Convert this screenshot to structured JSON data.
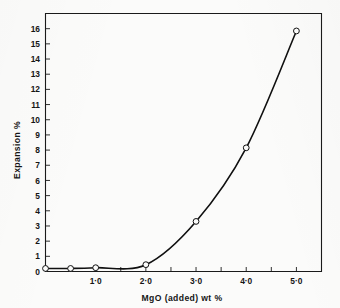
{
  "figure": {
    "background_color": "#fbfbfa",
    "ink_color": "#101010"
  },
  "chart_data": {
    "type": "line",
    "title": "",
    "xlabel": "MgO (added) wt %",
    "ylabel": "Expansion %",
    "xlim": [
      0,
      5.5
    ],
    "ylim": [
      0,
      17
    ],
    "grid": false,
    "legend": null,
    "marker": "open-circle",
    "x": [
      0.0,
      0.5,
      1.0,
      2.0,
      3.0,
      4.0,
      5.0
    ],
    "values": [
      0.2,
      0.2,
      0.25,
      0.45,
      3.3,
      8.15,
      15.85
    ],
    "series": [
      {
        "name": "Expansion vs MgO added",
        "x": [
          0.0,
          0.5,
          1.0,
          2.0,
          3.0,
          4.0,
          5.0
        ],
        "values": [
          0.2,
          0.2,
          0.25,
          0.45,
          3.3,
          8.15,
          15.85
        ]
      }
    ],
    "x_ticks": [
      {
        "value": 1.0,
        "label": "1·0"
      },
      {
        "value": 2.0,
        "label": "2·0"
      },
      {
        "value": 3.0,
        "label": "3·0"
      },
      {
        "value": 4.0,
        "label": "4·0"
      },
      {
        "value": 5.0,
        "label": "5·0"
      }
    ],
    "x_minor_ticks": [
      0.0,
      0.5,
      1.0,
      1.5,
      2.0,
      2.5,
      3.0,
      3.5,
      4.0,
      4.5,
      5.0,
      5.5
    ],
    "y_ticks": [
      {
        "value": 0,
        "label": "0"
      },
      {
        "value": 1,
        "label": "1"
      },
      {
        "value": 2,
        "label": "2"
      },
      {
        "value": 3,
        "label": "3"
      },
      {
        "value": 4,
        "label": "4"
      },
      {
        "value": 5,
        "label": "5"
      },
      {
        "value": 6,
        "label": "6"
      },
      {
        "value": 7,
        "label": "7"
      },
      {
        "value": 8,
        "label": "8"
      },
      {
        "value": 9,
        "label": "9"
      },
      {
        "value": 10,
        "label": "10"
      },
      {
        "value": 11,
        "label": "11"
      },
      {
        "value": 12,
        "label": "12"
      },
      {
        "value": 13,
        "label": "13"
      },
      {
        "value": 14,
        "label": "14"
      },
      {
        "value": 15,
        "label": "15"
      },
      {
        "value": 16,
        "label": "16"
      }
    ]
  }
}
